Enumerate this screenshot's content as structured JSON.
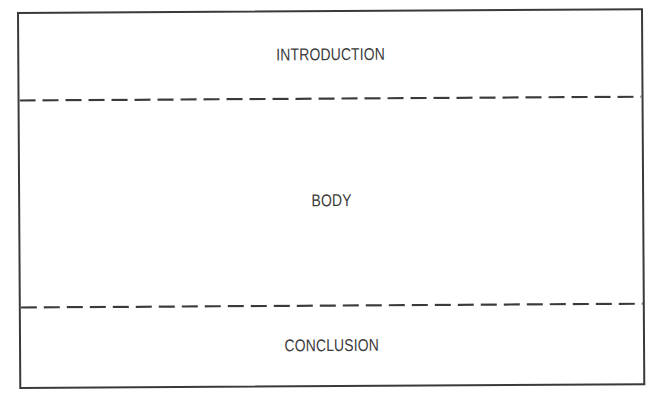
{
  "diagram": {
    "title": "",
    "sections": [
      {
        "id": "introduction",
        "label": "INTRODUCTION"
      },
      {
        "id": "body",
        "label": "BODY"
      },
      {
        "id": "conclusion",
        "label": "CONCLUSION"
      }
    ],
    "dividers": [
      {
        "between": [
          "introduction",
          "body"
        ],
        "style": "dashed"
      },
      {
        "between": [
          "body",
          "conclusion"
        ],
        "style": "dashed"
      }
    ],
    "colors": {
      "stroke": "#3a3a3a",
      "text": "#3a3a3a",
      "background": "#ffffff"
    }
  }
}
